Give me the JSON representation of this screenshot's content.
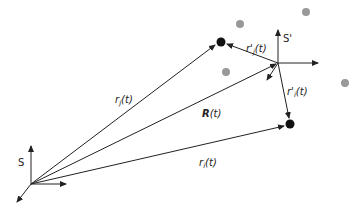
{
  "diagram": {
    "frames": {
      "lab": {
        "label": "S"
      },
      "moving": {
        "label": "S'"
      }
    },
    "vectors": {
      "r_j": {
        "label": "r",
        "sub": "j",
        "arg": "(t)"
      },
      "R": {
        "label": "R",
        "arg": "(t)"
      },
      "r_i": {
        "label": "r",
        "sub": "i",
        "arg": "(t)"
      },
      "r_prime_j": {
        "label": "r'",
        "sub": "j",
        "arg": "(t)"
      },
      "r_prime_i": {
        "label": "r'",
        "sub": "i",
        "arg": "(t)"
      }
    },
    "colors": {
      "line": "#222222",
      "particle": "#111111",
      "background_particle": "#999999"
    }
  }
}
